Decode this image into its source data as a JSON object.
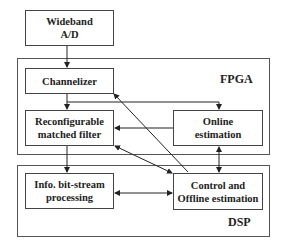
{
  "regions": {
    "fpga": {
      "label": "FPGA"
    },
    "dsp": {
      "label": "DSP"
    }
  },
  "blocks": {
    "wideband": {
      "line1": "Wideband",
      "line2": "A/D"
    },
    "channelizer": {
      "line1": "Channelizer"
    },
    "matched_filter": {
      "line1": "Reconfigurable",
      "line2": "matched filter"
    },
    "online": {
      "line1": "Online",
      "line2": "estimation"
    },
    "info": {
      "line1": "Info. bit-stream",
      "line2": "processing"
    },
    "control": {
      "line1": "Control and",
      "line2": "Offline estimation"
    }
  },
  "connections": [
    {
      "from": "Wideband A/D",
      "to": "Channelizer",
      "type": "one-way"
    },
    {
      "from": "Channelizer",
      "to": "Reconfigurable matched filter",
      "type": "one-way"
    },
    {
      "from": "Channelizer",
      "to": "Online estimation",
      "type": "one-way"
    },
    {
      "from": "Online estimation",
      "to": "Reconfigurable matched filter",
      "type": "one-way"
    },
    {
      "from": "Control and Offline estimation",
      "to": "Channelizer",
      "type": "one-way"
    },
    {
      "from": "Reconfigurable matched filter",
      "to": "Control and Offline estimation",
      "type": "two-way"
    },
    {
      "from": "Online estimation",
      "to": "Control and Offline estimation",
      "type": "two-way"
    },
    {
      "from": "Reconfigurable matched filter",
      "to": "Info. bit-stream processing",
      "type": "one-way"
    },
    {
      "from": "Info. bit-stream processing",
      "to": "Control and Offline estimation",
      "type": "two-way"
    }
  ]
}
